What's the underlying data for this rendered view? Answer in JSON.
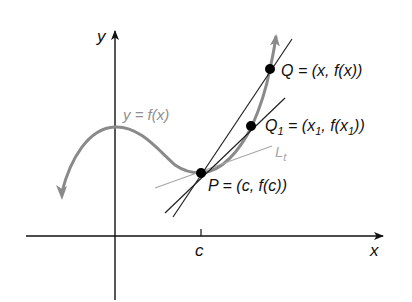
{
  "diagram": {
    "colors": {
      "axes": "#111111",
      "curve": "#8a8a8a",
      "tangent": "#a8a8a8",
      "secant": "#222222",
      "point": "#000000",
      "curve_label": "#8f8f8f"
    },
    "axes": {
      "x_label": "x",
      "y_label": "y",
      "tick_label_c": "c"
    },
    "curve": {
      "label": "y = f(x)"
    },
    "tangent_line": {
      "label_main": "L",
      "label_sub": "t"
    },
    "points": {
      "P": {
        "label": "P = (c, f(c))"
      },
      "Q": {
        "label": "Q = (x, f(x))"
      },
      "Q1": {
        "name": "Q",
        "name_sub": "1",
        "eq_open": " = (x",
        "x_sub": "1",
        "mid": ", f(x",
        "fx_sub": "1",
        "close": "))"
      }
    }
  }
}
